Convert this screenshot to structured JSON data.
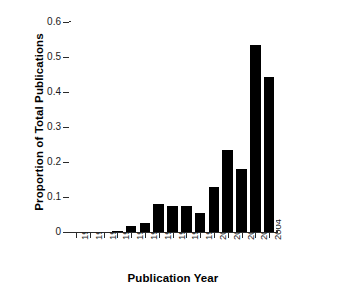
{
  "chart_data": {
    "type": "bar",
    "title": "",
    "xlabel": "Publication Year",
    "ylabel": "Proportion of Total Publications",
    "categories": [
      "1990",
      "1991",
      "1992",
      "1993",
      "1994",
      "1995",
      "1996",
      "1997",
      "1998",
      "1999",
      "2000",
      "2001",
      "2002",
      "2003",
      "2004"
    ],
    "values": [
      0.0,
      0.0,
      0.0,
      0.003,
      0.018,
      0.027,
      0.08,
      0.075,
      0.073,
      0.053,
      0.129,
      0.234,
      0.18,
      0.534,
      0.443
    ],
    "ylim": [
      0,
      0.6
    ],
    "xlim_note": "categorical",
    "ytick_labels": [
      "0",
      "0.1",
      "0.2",
      "0.3",
      "0.4",
      "0.5",
      "0.6"
    ],
    "ytick_values": [
      0,
      0.1,
      0.2,
      0.3,
      0.4,
      0.5,
      0.6
    ],
    "grid": false,
    "legend": null,
    "bar_color": "#000000",
    "axis_color": "#2b2b2b",
    "background_color": "#ffffff"
  }
}
